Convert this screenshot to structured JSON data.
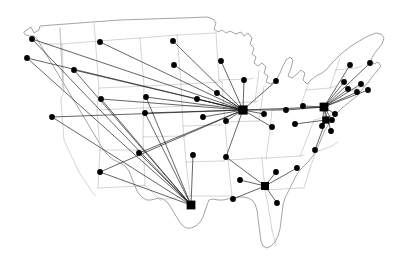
{
  "figure": {
    "width": 407,
    "height": 274,
    "background_color": "#ffffff",
    "state_border_color": "#b9b9b9",
    "nation_outline_color": "#8d8d8d",
    "route_color": "#111111",
    "node_color": "#000000"
  },
  "chart_data": {
    "type": "scatter",
    "subtitle": "",
    "xlabel": "",
    "ylabel": "",
    "grid": false,
    "legend": "none",
    "projection": "contiguous-united-states",
    "xlim": [
      0,
      407
    ],
    "ylim": [
      0,
      274
    ],
    "hubs": [
      {
        "id": "chicago",
        "label": "Chicago hub",
        "x": 243,
        "y": 110,
        "size": 4.6,
        "degree": 24
      },
      {
        "id": "newyork",
        "label": "New York hub",
        "x": 324,
        "y": 107,
        "size": 4.4,
        "degree": 16
      },
      {
        "id": "washington",
        "label": "Washington hub",
        "x": 326,
        "y": 120,
        "size": 3.6,
        "degree": 7
      },
      {
        "id": "dallas",
        "label": "Dallas hub",
        "x": 191,
        "y": 205,
        "size": 4.4,
        "degree": 10
      },
      {
        "id": "atlanta",
        "label": "Atlanta hub",
        "x": 265,
        "y": 186,
        "size": 4.0,
        "degree": 8
      }
    ],
    "nodes": [
      {
        "id": "n01",
        "label": "Seattle",
        "x": 32,
        "y": 39,
        "size": 2.9
      },
      {
        "id": "n02",
        "label": "Portland",
        "x": 27,
        "y": 58,
        "size": 2.9
      },
      {
        "id": "n03",
        "label": "Spokane",
        "x": 100,
        "y": 42,
        "size": 2.9
      },
      {
        "id": "n04",
        "label": "Boise",
        "x": 74,
        "y": 70,
        "size": 2.9
      },
      {
        "id": "n05",
        "label": "Billings",
        "x": 173,
        "y": 41,
        "size": 2.9
      },
      {
        "id": "n06",
        "label": "Bismarck",
        "x": 174,
        "y": 65,
        "size": 2.9
      },
      {
        "id": "n07",
        "label": "Minneapolis",
        "x": 221,
        "y": 61,
        "size": 2.9
      },
      {
        "id": "n08",
        "label": "Green Bay",
        "x": 244,
        "y": 80,
        "size": 2.9
      },
      {
        "id": "n09",
        "label": "Detroit",
        "x": 276,
        "y": 81,
        "size": 2.9
      },
      {
        "id": "n10",
        "label": "Sioux Falls",
        "x": 217,
        "y": 93,
        "size": 2.9
      },
      {
        "id": "n11",
        "label": "Omaha",
        "x": 197,
        "y": 99,
        "size": 2.9
      },
      {
        "id": "n12",
        "label": "Salt Lake City",
        "x": 101,
        "y": 99,
        "size": 2.9
      },
      {
        "id": "n13",
        "label": "Denver",
        "x": 146,
        "y": 97,
        "size": 2.9
      },
      {
        "id": "n14",
        "label": "San Francisco",
        "x": 52,
        "y": 117,
        "size": 2.9
      },
      {
        "id": "n15",
        "label": "Colorado Springs",
        "x": 145,
        "y": 113,
        "size": 2.9
      },
      {
        "id": "n16",
        "label": "Kansas City",
        "x": 203,
        "y": 117,
        "size": 2.9
      },
      {
        "id": "n17",
        "label": "St. Louis",
        "x": 226,
        "y": 121,
        "size": 2.9
      },
      {
        "id": "n18",
        "label": "Indianapolis",
        "x": 264,
        "y": 114,
        "size": 2.9
      },
      {
        "id": "n19",
        "label": "Columbus",
        "x": 286,
        "y": 110,
        "size": 2.9
      },
      {
        "id": "n20",
        "label": "Louisville",
        "x": 272,
        "y": 127,
        "size": 2.9
      },
      {
        "id": "n21",
        "label": "Charleston WV",
        "x": 295,
        "y": 124,
        "size": 2.9
      },
      {
        "id": "n22",
        "label": "Albuquerque",
        "x": 139,
        "y": 153,
        "size": 2.9
      },
      {
        "id": "n23",
        "label": "Phoenix",
        "x": 100,
        "y": 172,
        "size": 2.9
      },
      {
        "id": "n24",
        "label": "Oklahoma City",
        "x": 193,
        "y": 155,
        "size": 2.9
      },
      {
        "id": "n25",
        "label": "Memphis",
        "x": 226,
        "y": 157,
        "size": 2.9
      },
      {
        "id": "n26",
        "label": "Raleigh",
        "x": 331,
        "y": 131,
        "size": 2.9
      },
      {
        "id": "n27",
        "label": "Norfolk",
        "x": 315,
        "y": 150,
        "size": 2.9
      },
      {
        "id": "n28",
        "label": "Knoxville",
        "x": 276,
        "y": 172,
        "size": 2.9
      },
      {
        "id": "n29",
        "label": "Charlotte",
        "x": 297,
        "y": 168,
        "size": 2.9
      },
      {
        "id": "n30",
        "label": "Jackson",
        "x": 240,
        "y": 180,
        "size": 2.9
      },
      {
        "id": "n31",
        "label": "New Orleans",
        "x": 233,
        "y": 199,
        "size": 2.9
      },
      {
        "id": "n32",
        "label": "Jacksonville",
        "x": 277,
        "y": 203,
        "size": 2.9
      },
      {
        "id": "n33",
        "label": "Burlington",
        "x": 350,
        "y": 65,
        "size": 2.9
      },
      {
        "id": "n34",
        "label": "Bangor",
        "x": 370,
        "y": 63,
        "size": 2.9
      },
      {
        "id": "n35",
        "label": "Syracuse",
        "x": 344,
        "y": 82,
        "size": 2.9
      },
      {
        "id": "n36",
        "label": "Boston",
        "x": 368,
        "y": 90,
        "size": 2.9
      },
      {
        "id": "n37",
        "label": "Hartford",
        "x": 357,
        "y": 92,
        "size": 2.9
      },
      {
        "id": "n38",
        "label": "Albany",
        "x": 348,
        "y": 89,
        "size": 2.9
      },
      {
        "id": "n39",
        "label": "Providence",
        "x": 361,
        "y": 84,
        "size": 2.9
      },
      {
        "id": "n40",
        "label": "Philadelphia",
        "x": 335,
        "y": 114,
        "size": 2.9
      },
      {
        "id": "n41",
        "label": "Baltimore",
        "x": 332,
        "y": 120,
        "size": 2.9
      },
      {
        "id": "n42",
        "label": "Richmond",
        "x": 322,
        "y": 126,
        "size": 2.9
      },
      {
        "id": "n43",
        "label": "Pittsburgh",
        "x": 303,
        "y": 106,
        "size": 2.9
      }
    ],
    "routes": [
      {
        "from": "chicago",
        "to": "n01"
      },
      {
        "from": "chicago",
        "to": "n02"
      },
      {
        "from": "chicago",
        "to": "n03"
      },
      {
        "from": "chicago",
        "to": "n04"
      },
      {
        "from": "chicago",
        "to": "n05"
      },
      {
        "from": "chicago",
        "to": "n06"
      },
      {
        "from": "chicago",
        "to": "n07"
      },
      {
        "from": "chicago",
        "to": "n08"
      },
      {
        "from": "chicago",
        "to": "n09"
      },
      {
        "from": "chicago",
        "to": "n10"
      },
      {
        "from": "chicago",
        "to": "n11"
      },
      {
        "from": "chicago",
        "to": "n12"
      },
      {
        "from": "chicago",
        "to": "n13"
      },
      {
        "from": "chicago",
        "to": "n14"
      },
      {
        "from": "chicago",
        "to": "n15"
      },
      {
        "from": "chicago",
        "to": "n16"
      },
      {
        "from": "chicago",
        "to": "n17"
      },
      {
        "from": "chicago",
        "to": "n18"
      },
      {
        "from": "chicago",
        "to": "n19"
      },
      {
        "from": "chicago",
        "to": "n20"
      },
      {
        "from": "chicago",
        "to": "n25"
      },
      {
        "from": "chicago",
        "to": "n23"
      },
      {
        "from": "chicago",
        "to": "n22"
      },
      {
        "from": "chicago",
        "to": "newyork"
      },
      {
        "from": "newyork",
        "to": "n33"
      },
      {
        "from": "newyork",
        "to": "n34"
      },
      {
        "from": "newyork",
        "to": "n35"
      },
      {
        "from": "newyork",
        "to": "n36"
      },
      {
        "from": "newyork",
        "to": "n37"
      },
      {
        "from": "newyork",
        "to": "n38"
      },
      {
        "from": "newyork",
        "to": "n39"
      },
      {
        "from": "newyork",
        "to": "n40"
      },
      {
        "from": "newyork",
        "to": "n41"
      },
      {
        "from": "newyork",
        "to": "n42"
      },
      {
        "from": "newyork",
        "to": "n43"
      },
      {
        "from": "newyork",
        "to": "n26"
      },
      {
        "from": "newyork",
        "to": "n19"
      },
      {
        "from": "newyork",
        "to": "washington"
      },
      {
        "from": "washington",
        "to": "n27"
      },
      {
        "from": "washington",
        "to": "n42"
      },
      {
        "from": "washington",
        "to": "n41"
      },
      {
        "from": "washington",
        "to": "n21"
      },
      {
        "from": "dallas",
        "to": "n01"
      },
      {
        "from": "dallas",
        "to": "n02"
      },
      {
        "from": "dallas",
        "to": "n04"
      },
      {
        "from": "dallas",
        "to": "n12"
      },
      {
        "from": "dallas",
        "to": "n13"
      },
      {
        "from": "dallas",
        "to": "n15"
      },
      {
        "from": "dallas",
        "to": "n14"
      },
      {
        "from": "dallas",
        "to": "n22"
      },
      {
        "from": "dallas",
        "to": "n23"
      },
      {
        "from": "dallas",
        "to": "n24"
      },
      {
        "from": "atlanta",
        "to": "n28"
      },
      {
        "from": "atlanta",
        "to": "n29"
      },
      {
        "from": "atlanta",
        "to": "n30"
      },
      {
        "from": "atlanta",
        "to": "n31"
      },
      {
        "from": "atlanta",
        "to": "n32"
      },
      {
        "from": "atlanta",
        "to": "n25"
      }
    ]
  }
}
